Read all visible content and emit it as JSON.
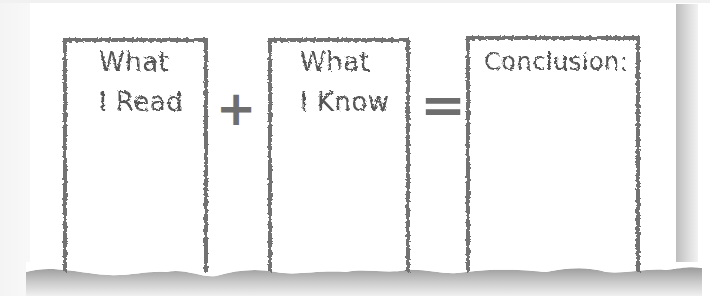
{
  "diagram": {
    "boxes": [
      {
        "label_line1": "What",
        "label_line2": "I Read"
      },
      {
        "label_line1": "What",
        "label_line2": "I Know"
      },
      {
        "label_line1": "Conclusion:",
        "label_line2": ""
      }
    ],
    "operators": {
      "plus": "+",
      "equals": "="
    },
    "colors": {
      "border": "#727272",
      "text": "#555555",
      "shadow": "#bdbdbd"
    }
  }
}
